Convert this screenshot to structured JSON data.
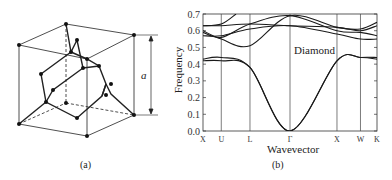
{
  "panel_a": {
    "caption": "(a)",
    "lattice_label": "a"
  },
  "panel_b": {
    "caption": "(b)"
  },
  "chart_data": {
    "type": "line",
    "title": "",
    "annotation": "Diamond",
    "xlabel": "Wavevector",
    "ylabel": "Frequency",
    "ylim": [
      0.0,
      0.7
    ],
    "yticks": [
      "0.0",
      "0.1",
      "0.2",
      "0.3",
      "0.4",
      "0.5",
      "0.6",
      "0.7"
    ],
    "xticks": [
      "X",
      "U",
      "L",
      "Γ",
      "X",
      "W",
      "K"
    ],
    "xtick_pos": [
      0,
      0.105,
      0.27,
      0.5,
      0.77,
      0.905,
      1.0
    ],
    "grid": "vertical lines at high-symmetry points",
    "series": [
      {
        "name": "acoustic-LA",
        "points": [
          [
            0,
            0.43
          ],
          [
            0.105,
            0.44
          ],
          [
            0.27,
            0.38
          ],
          [
            0.5,
            0.0
          ],
          [
            0.77,
            0.42
          ],
          [
            0.905,
            0.44
          ],
          [
            1.0,
            0.44
          ]
        ]
      },
      {
        "name": "acoustic-TA",
        "points": [
          [
            0,
            0.42
          ],
          [
            0.105,
            0.42
          ],
          [
            0.27,
            0.38
          ],
          [
            0.5,
            0.0
          ],
          [
            0.77,
            0.42
          ],
          [
            0.905,
            0.44
          ],
          [
            1.0,
            0.43
          ]
        ]
      },
      {
        "name": "optical-1",
        "points": [
          [
            0,
            0.6
          ],
          [
            0.105,
            0.55
          ],
          [
            0.27,
            0.51
          ],
          [
            0.5,
            0.69
          ],
          [
            0.77,
            0.62
          ],
          [
            0.905,
            0.61
          ],
          [
            1.0,
            0.65
          ]
        ]
      },
      {
        "name": "optical-2",
        "points": [
          [
            0,
            0.59
          ],
          [
            0.105,
            0.56
          ],
          [
            0.27,
            0.64
          ],
          [
            0.5,
            0.69
          ],
          [
            0.77,
            0.6
          ],
          [
            0.905,
            0.59
          ],
          [
            1.0,
            0.57
          ]
        ]
      },
      {
        "name": "optical-3",
        "points": [
          [
            0,
            0.63
          ],
          [
            0.105,
            0.63
          ],
          [
            0.27,
            0.64
          ],
          [
            0.5,
            0.63
          ],
          [
            0.77,
            0.62
          ],
          [
            0.905,
            0.6
          ],
          [
            1.0,
            0.63
          ]
        ]
      },
      {
        "name": "optical-4",
        "points": [
          [
            0,
            0.57
          ],
          [
            0.105,
            0.57
          ],
          [
            0.27,
            0.61
          ],
          [
            0.5,
            0.63
          ],
          [
            0.77,
            0.58
          ],
          [
            0.905,
            0.55
          ],
          [
            1.0,
            0.55
          ]
        ]
      },
      {
        "name": "optical-5",
        "points": [
          [
            0,
            0.63
          ],
          [
            0.105,
            0.64
          ],
          [
            0.19,
            0.7
          ]
        ]
      }
    ]
  }
}
